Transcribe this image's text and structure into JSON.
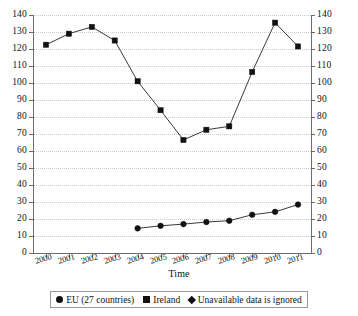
{
  "chart_data": {
    "type": "line",
    "title": "",
    "xlabel": "Time",
    "ylabel": "",
    "categories": [
      "2000",
      "2001",
      "2002",
      "2003",
      "2004",
      "2005",
      "2006",
      "2007",
      "2008",
      "2009",
      "2010",
      "2011"
    ],
    "ylim": [
      0,
      140
    ],
    "y_ticks": [
      0,
      10,
      20,
      30,
      40,
      50,
      60,
      70,
      80,
      90,
      100,
      110,
      120,
      130,
      140
    ],
    "grid": true,
    "dual_axis": true,
    "legend_position": "bottom",
    "series": [
      {
        "name": "EU (27 countries)",
        "marker": "circle",
        "values": [
          null,
          null,
          null,
          null,
          14.5,
          16.0,
          17.0,
          18.2,
          19.0,
          22.5,
          24.2,
          28.5
        ]
      },
      {
        "name": "Ireland",
        "marker": "square",
        "values": [
          122.5,
          129.0,
          133.0,
          125.0,
          101.0,
          84.0,
          66.5,
          72.5,
          74.5,
          106.5,
          135.5,
          121.5
        ]
      }
    ],
    "annotations": [
      {
        "marker": "diamond",
        "text": "Unavailable data is ignored"
      }
    ]
  },
  "axis": {
    "x_title": "Time",
    "left_tick_labels": [
      "140",
      "130",
      "120",
      "110",
      "100",
      "90",
      "80",
      "70",
      "60",
      "50",
      "40",
      "30",
      "20",
      "10",
      "0"
    ],
    "right_tick_labels": [
      "140",
      "130",
      "120",
      "110",
      "100",
      "90",
      "80",
      "70",
      "60",
      "50",
      "40",
      "30",
      "20",
      "10",
      "0"
    ]
  },
  "legend": {
    "items": [
      {
        "label": "EU (27 countries)",
        "marker": "circle"
      },
      {
        "label": "Ireland",
        "marker": "square"
      },
      {
        "label": "Unavailable data is ignored",
        "marker": "diamond"
      }
    ]
  }
}
